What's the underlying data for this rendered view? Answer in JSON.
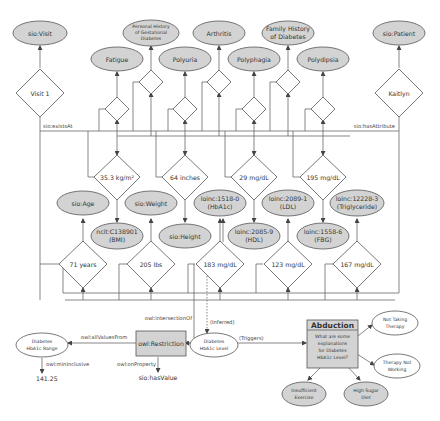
{
  "top_classes": {
    "visit": "sio:Visit",
    "personal_history": [
      "Personal History",
      "of Gestational",
      "Diabetes"
    ],
    "arthritis": "Arthritis",
    "family_history": [
      "Family History",
      "of Diabetes"
    ],
    "patient": "sio:Patient",
    "fatigue": "Fatigue",
    "polyuria": "Polyuria",
    "polyphagia": "Polyphagia",
    "polydipsia": "Polydipsia"
  },
  "instances": {
    "visit1": "Visit 1",
    "patient": "Kaitlyn"
  },
  "edge_labels": {
    "exists_at": "sio:existsAt",
    "has_attribute": "sio:hasAttribute",
    "intersection_of": "owl:intersectionOf",
    "all_values_from": "owl:allValuesFrom",
    "on_property": "owl:onProperty",
    "min_inclusive": "owl:minInclusive",
    "inferred": "(Inferred)",
    "triggers": "(Triggers)"
  },
  "mid_values": {
    "bmi": "35.3 kg/m²",
    "height": "64 inches",
    "hdl": "29 mg/dL",
    "fbg": "195 mg/dL"
  },
  "mid_classes": {
    "age": "sio:Age",
    "weight": "sio:Weight",
    "hba1c": [
      "loinc:1518-0",
      "(HbA1c)"
    ],
    "ldl": [
      "loinc:2089-1",
      "(LDL)"
    ],
    "triglyceride": [
      "loinc:12228-3",
      "(Triglyceride)"
    ],
    "bmi_class": [
      "ncit:C138901",
      "(BMI)"
    ],
    "height_class": "sio:Height",
    "hdl_class": [
      "loinc:2085-9",
      "(HDL)"
    ],
    "fbg_class": [
      "loinc:1558-6",
      "(FBG)"
    ]
  },
  "bottom_values": {
    "age": "71 years",
    "weight": "205 lbs",
    "hba1c": "183 mg/dL",
    "ldl": "123 mg/dL",
    "triglyceride": "167 mg/dL"
  },
  "restriction": {
    "label": "owl:Restriction",
    "range": [
      "Diabetes",
      "HbA1c Range"
    ],
    "min_value": "141.25",
    "property": "sio:hasValue",
    "level": [
      "Diabetes",
      "HbA1c Level"
    ]
  },
  "abduction": {
    "title": "Abduction",
    "question": [
      "What are some",
      "explanations",
      "for Diabetes",
      "HbA1c Level?"
    ],
    "explanations": {
      "not_taking": [
        "Not Taking",
        "Therapy"
      ],
      "not_working": [
        "Therapy Not",
        "Working"
      ],
      "exercise": [
        "Insufficient",
        "Exercise"
      ],
      "diet": [
        "High Sugar",
        "Diet"
      ]
    }
  }
}
